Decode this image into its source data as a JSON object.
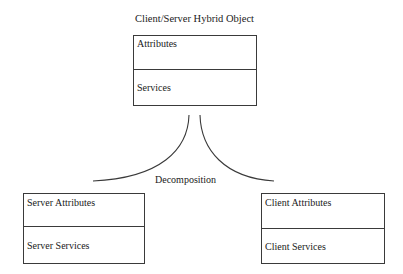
{
  "diagram": {
    "title": "Client/Server Hybrid Object",
    "connector_label": "Decomposition",
    "boxes": {
      "hybrid": {
        "attributes": "Attributes",
        "services": "Services"
      },
      "server": {
        "attributes": "Server Attributes",
        "services": "Server Services"
      },
      "client": {
        "attributes": "Client Attributes",
        "services": "Client Services"
      }
    },
    "colors": {
      "line": "#3a3a3a",
      "background": "#ffffff",
      "text": "#1a1a1a"
    }
  }
}
